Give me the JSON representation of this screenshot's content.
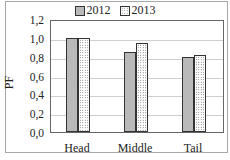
{
  "chart_data": {
    "type": "bar",
    "title": "",
    "xlabel": "",
    "ylabel": "PF",
    "categories": [
      "Head",
      "Middle",
      "Tail"
    ],
    "series": [
      {
        "name": "2012",
        "values": [
          1.0,
          0.85,
          0.8
        ],
        "color": "#b9b9b9",
        "pattern": "solid"
      },
      {
        "name": "2013",
        "values": [
          1.0,
          0.95,
          0.82
        ],
        "color": "#ffffff",
        "pattern": "dotted"
      }
    ],
    "ylim": [
      0,
      1.2
    ],
    "yticks": [
      "0,0",
      "0,2",
      "0,4",
      "0,6",
      "0,8",
      "1,0",
      "1,2"
    ],
    "grid": true,
    "legend_position": "top"
  }
}
